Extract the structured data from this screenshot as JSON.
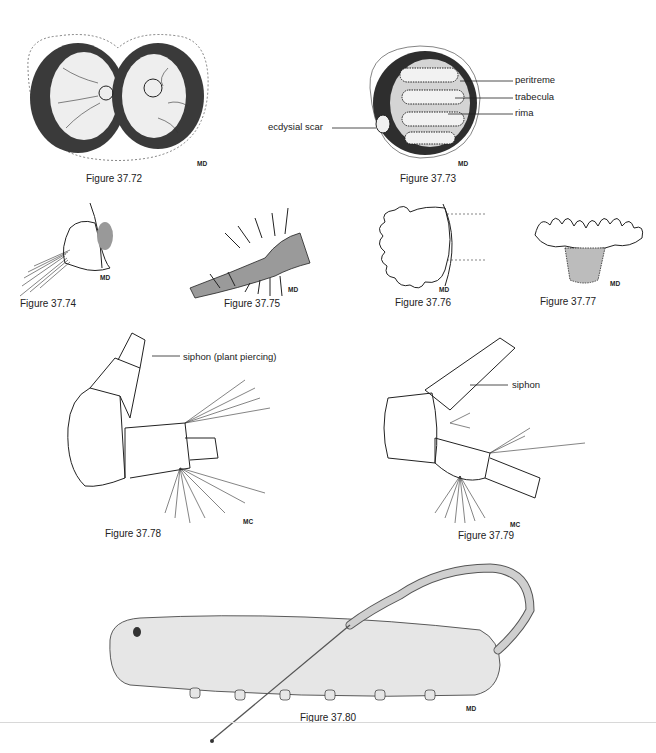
{
  "figures": [
    {
      "id": "37.72",
      "caption": "Figure 37.72",
      "initials": "MD"
    },
    {
      "id": "37.73",
      "caption": "Figure 37.73",
      "initials": "MD",
      "labels": {
        "peritreme": "peritreme",
        "trabecula": "trabecula",
        "rima": "rima",
        "ecdysial_scar": "ecdysial scar"
      }
    },
    {
      "id": "37.74",
      "caption": "Figure 37.74",
      "initials": "MD"
    },
    {
      "id": "37.75",
      "caption": "Figure 37.75",
      "initials": "MD"
    },
    {
      "id": "37.76",
      "caption": "Figure 37.76",
      "initials": "MD"
    },
    {
      "id": "37.77",
      "caption": "Figure 37.77",
      "initials": "MD"
    },
    {
      "id": "37.78",
      "caption": "Figure 37.78",
      "initials": "MC",
      "labels": {
        "siphon": "siphon (plant piercing)"
      }
    },
    {
      "id": "37.79",
      "caption": "Figure 37.79",
      "initials": "MC",
      "labels": {
        "siphon": "siphon"
      }
    },
    {
      "id": "37.80",
      "caption": "Figure 37.80",
      "initials": "MD"
    }
  ]
}
